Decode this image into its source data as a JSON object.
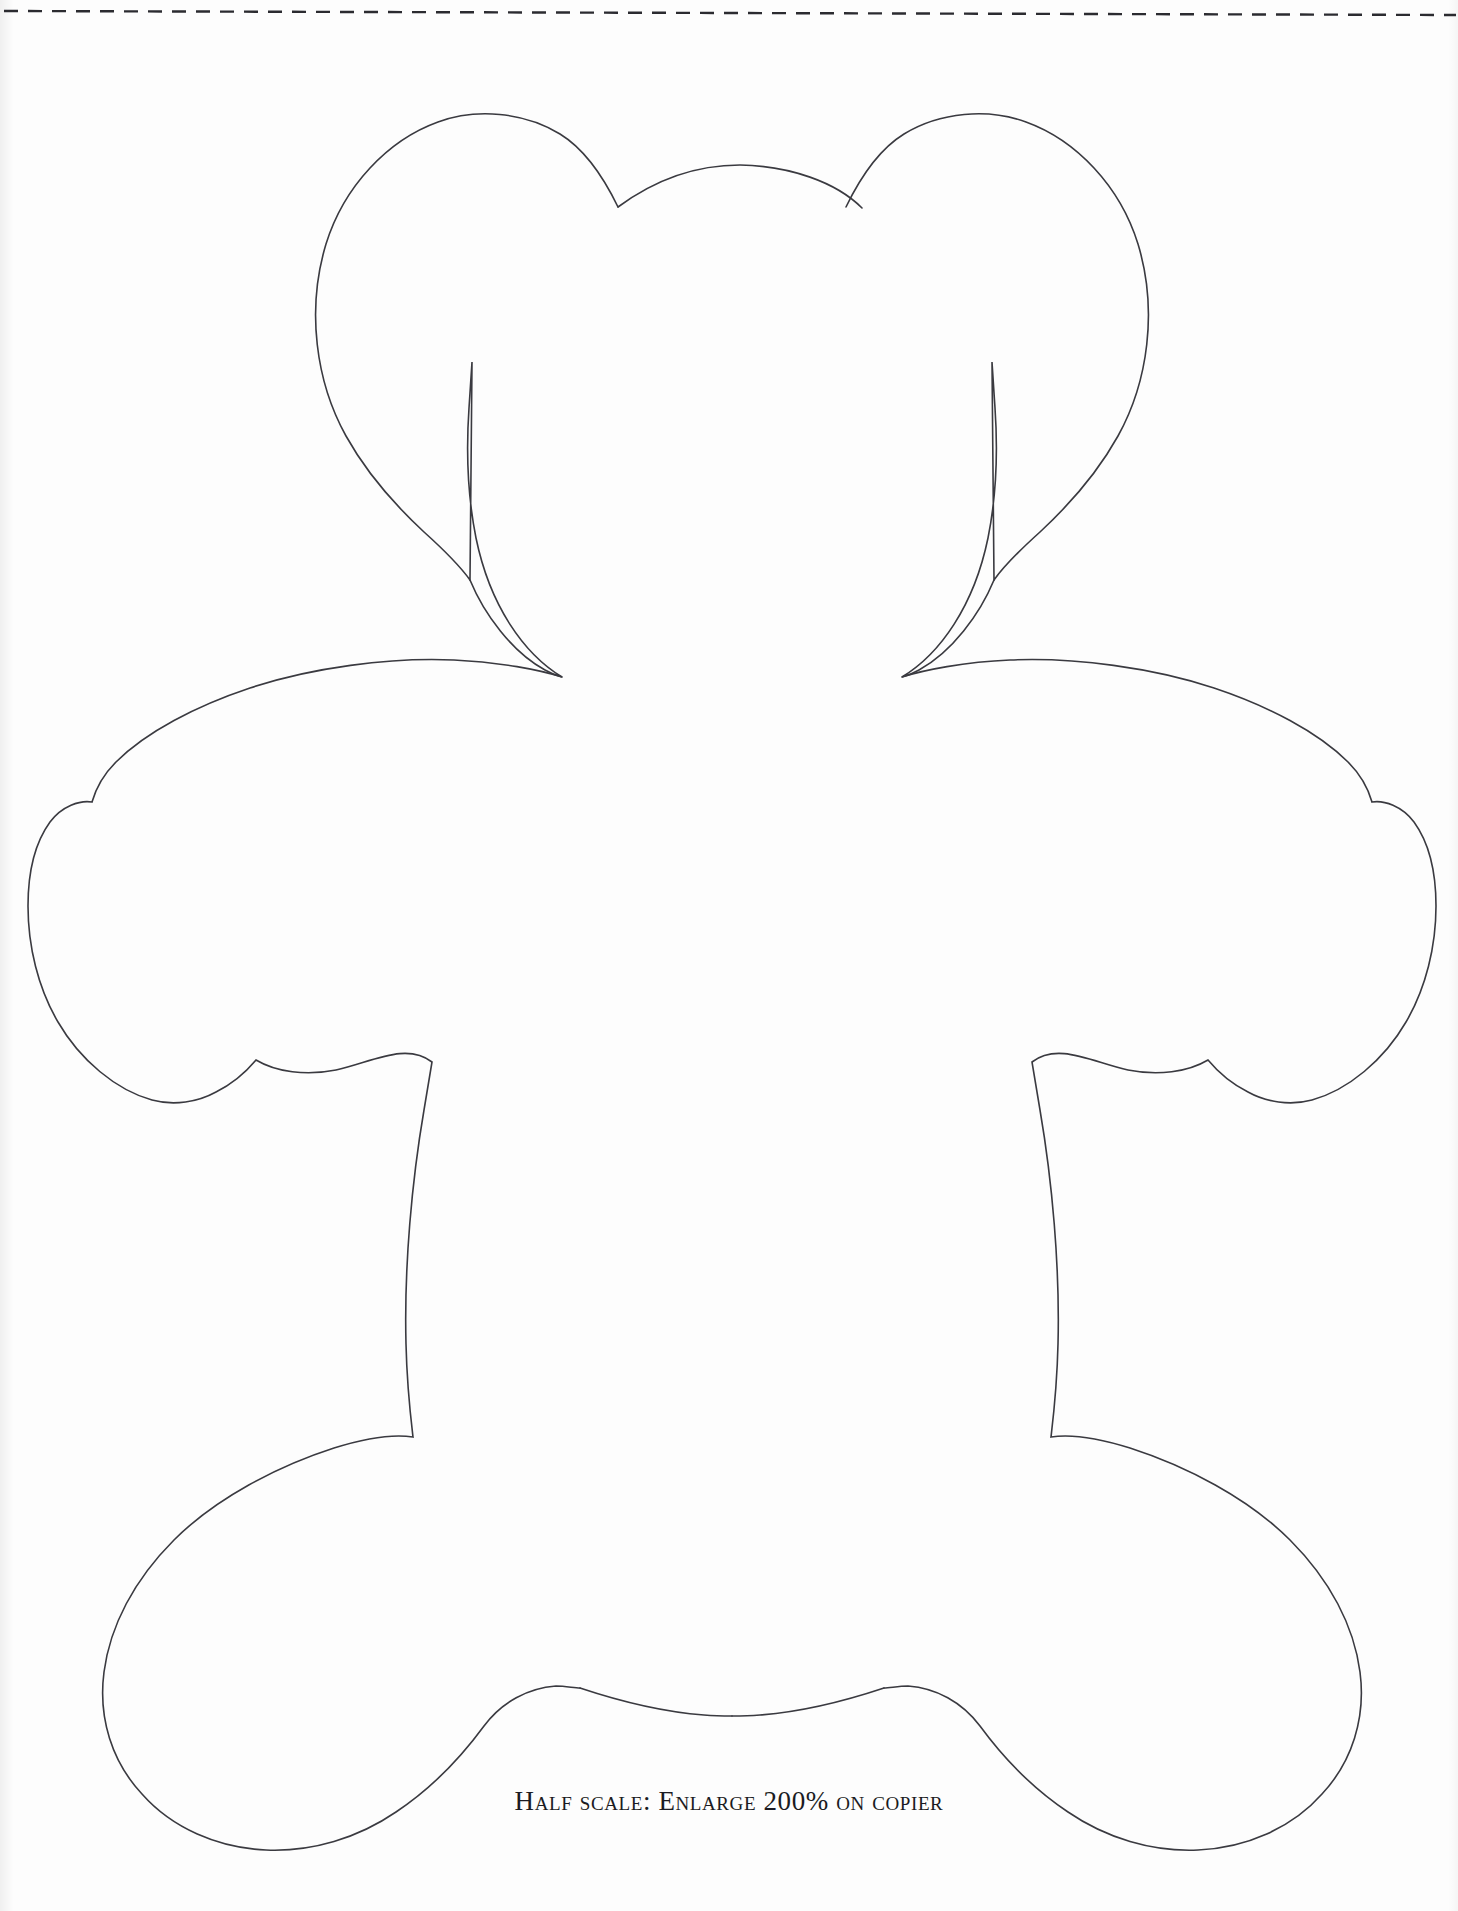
{
  "document": {
    "kind": "craft-pattern-template",
    "subject": "teddy bear body outline",
    "page_background_color": "#fdfdfd",
    "ink_color": "#3a3a40"
  },
  "cut_guide": {
    "name": "dashed-cut-line",
    "style": "dashed",
    "color": "#2b2b30",
    "orientation": "horizontal",
    "y_position_px": 12,
    "dash_pattern": "14 10"
  },
  "pattern": {
    "name": "teddy-bear-outline",
    "stroke_color": "#3a3a40",
    "stroke_width": 1.6,
    "fill": "none",
    "symmetry_axis_x": 732,
    "parts": [
      "left-ear",
      "right-ear",
      "head",
      "left-arm",
      "right-arm",
      "torso",
      "left-leg",
      "right-leg"
    ],
    "path": "M 618 207 C 600 168 560 128 500 122 C 420 114 340 170 327 247 C 310 345 352 424 398 472 C 424 500 450 530 462 560 L 472 362 L 468 420 C 466 470 470 520 482 560 C 498 612 528 652 562 677 C 540 668 470 650 380 664 C 290 678 190 706 140 746 C 92 784 60 830 44 880 C 28 932 32 986 52 1032 C 74 1082 118 1122 164 1140 C 198 1152 236 1152 266 1140 C 300 1126 330 1100 352 1072 L 432 1062 L 422 1130 C 410 1210 404 1300 410 1380 C 412 1408 414 1424 413 1437 C 380 1438 320 1450 264 1472 C 200 1496 140 1538 110 1590 C 80 1642 78 1700 96 1748 C 116 1800 164 1842 218 1858 C 272 1874 332 1866 382 1840 C 430 1816 470 1776 500 1738 C 528 1704 556 1688 580 1688 C 640 1708 700 1718 732 1718",
    "path_mirrored": true
  },
  "caption": {
    "name": "scale-instruction",
    "text": "Half scale: Enlarge 200% on copier",
    "font_style": "small-caps serif",
    "color": "#1b1b22"
  }
}
